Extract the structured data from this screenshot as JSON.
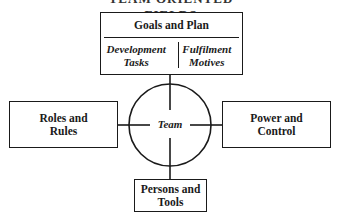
{
  "diagram": {
    "cut_off_title": "TEAM ORIENTED FIELDS",
    "top_box": {
      "header": "Goals and Plan",
      "left_column": [
        "Development",
        "Tasks"
      ],
      "right_column": [
        "Fulfilment",
        "Motives"
      ]
    },
    "center": {
      "label": "Team"
    },
    "left_box": {
      "lines": [
        "Roles and",
        "Rules"
      ]
    },
    "right_box": {
      "lines": [
        "Power and",
        "Control"
      ]
    },
    "bottom_box": {
      "lines": [
        "Persons and",
        "Tools"
      ]
    },
    "colors": {
      "stroke": "#1a1a1a",
      "background": "#ffffff"
    }
  }
}
